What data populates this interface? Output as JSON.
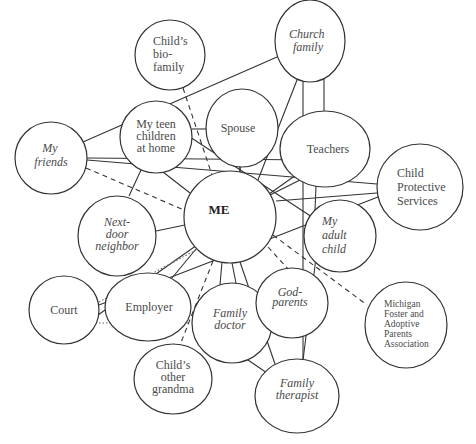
{
  "diagram": {
    "type": "ecomap",
    "nodes": [
      {
        "id": "me",
        "lines": [
          "ME"
        ],
        "style": "bold",
        "cx": 230,
        "cy": 217,
        "rx": 46,
        "ry": 46
      },
      {
        "id": "childs-bio-family",
        "lines": [
          "Child’s",
          "bio-",
          "family"
        ],
        "style": "normal",
        "cx": 170,
        "cy": 55,
        "rx": 35,
        "ry": 35
      },
      {
        "id": "church-family",
        "lines": [
          "Church",
          "family"
        ],
        "style": "italic",
        "cx": 310,
        "cy": 41,
        "rx": 35,
        "ry": 41
      },
      {
        "id": "my-teen-children",
        "lines": [
          "My teen",
          "children",
          "at home"
        ],
        "style": "normal",
        "cx": 156,
        "cy": 137,
        "rx": 36,
        "ry": 36
      },
      {
        "id": "spouse",
        "lines": [
          "Spouse"
        ],
        "style": "normal",
        "cx": 242,
        "cy": 128,
        "rx": 36,
        "ry": 39
      },
      {
        "id": "teachers",
        "lines": [
          "Teachers"
        ],
        "style": "normal",
        "cx": 325,
        "cy": 149,
        "rx": 45,
        "ry": 38
      },
      {
        "id": "my-friends",
        "lines": [
          "My",
          "friends"
        ],
        "style": "italic",
        "cx": 51,
        "cy": 158,
        "rx": 36,
        "ry": 36
      },
      {
        "id": "child-protective-services",
        "lines": [
          "Child",
          "Protective",
          "Services"
        ],
        "style": "normal",
        "cx": 420,
        "cy": 187,
        "rx": 43,
        "ry": 43
      },
      {
        "id": "next-door-neighbor",
        "lines": [
          "Next-",
          "door",
          "neighbor"
        ],
        "style": "italic",
        "cx": 117,
        "cy": 236,
        "rx": 39,
        "ry": 40
      },
      {
        "id": "my-adult-child",
        "lines": [
          "My",
          "adult",
          "child"
        ],
        "style": "italic",
        "cx": 340,
        "cy": 236,
        "rx": 36,
        "ry": 36
      },
      {
        "id": "court",
        "lines": [
          "Court"
        ],
        "style": "normal",
        "cx": 64,
        "cy": 310,
        "rx": 35,
        "ry": 34
      },
      {
        "id": "employer",
        "lines": [
          "Employer"
        ],
        "style": "normal",
        "cx": 148,
        "cy": 307,
        "rx": 43,
        "ry": 34
      },
      {
        "id": "family-doctor",
        "lines": [
          "Family",
          "doctor"
        ],
        "style": "italic",
        "cx": 232,
        "cy": 323,
        "rx": 40,
        "ry": 40
      },
      {
        "id": "god-parents",
        "lines": [
          "God-",
          "parents"
        ],
        "style": "italic",
        "cx": 292,
        "cy": 303,
        "rx": 36,
        "ry": 35
      },
      {
        "id": "michigan-fapa",
        "lines": [
          "Michigan",
          "Foster and",
          "Adoptive",
          "Parents",
          "Association"
        ],
        "style": "small",
        "cx": 406,
        "cy": 325,
        "rx": 41,
        "ry": 43
      },
      {
        "id": "childs-other-grandma",
        "lines": [
          "Child’s",
          "other",
          "grandma"
        ],
        "style": "normal",
        "cx": 173,
        "cy": 379,
        "rx": 39,
        "ry": 35
      },
      {
        "id": "family-therapist",
        "lines": [
          "Family",
          "therapist"
        ],
        "style": "italic",
        "cx": 297,
        "cy": 396,
        "rx": 42,
        "ry": 37
      }
    ],
    "edges": [
      {
        "from": "my-friends",
        "to": "church-family",
        "style": "solid"
      },
      {
        "from": "my-friends",
        "to": "child-protective-services",
        "style": "solid"
      },
      {
        "from": "my-friends",
        "to": "teachers",
        "style": "solid"
      },
      {
        "from": "my-friends",
        "to": "me",
        "style": "dashed"
      },
      {
        "from": "childs-bio-family",
        "to": "me",
        "style": "dashed"
      },
      {
        "from": "my-teen-children",
        "to": "spouse",
        "style": "solid"
      },
      {
        "from": "my-teen-children",
        "to": "me",
        "style": "solid"
      },
      {
        "from": "my-teen-children",
        "to": "my-adult-child",
        "style": "solid"
      },
      {
        "from": "my-teen-children",
        "to": "next-door-neighbor",
        "style": "solid"
      },
      {
        "from": "spouse",
        "to": "me",
        "style": "solid"
      },
      {
        "from": "church-family",
        "to": "teachers",
        "style": "solid"
      },
      {
        "from": "church-family",
        "to": "me",
        "style": "solid"
      },
      {
        "from": "church-family",
        "to": "family-therapist",
        "style": "solid"
      },
      {
        "from": "teachers",
        "to": "me",
        "style": "solid"
      },
      {
        "from": "teachers",
        "to": "court",
        "style": "solid"
      },
      {
        "from": "teachers",
        "to": "my-adult-child",
        "style": "solid"
      },
      {
        "from": "child-protective-services",
        "to": "me",
        "style": "solid"
      },
      {
        "from": "child-protective-services",
        "to": "court",
        "style": "solid"
      },
      {
        "from": "next-door-neighbor",
        "to": "me",
        "style": "solid"
      },
      {
        "from": "my-adult-child",
        "to": "family-therapist",
        "style": "solid"
      },
      {
        "from": "me",
        "to": "family-doctor",
        "style": "solid"
      },
      {
        "from": "me",
        "to": "god-parents",
        "style": "dashed"
      },
      {
        "from": "me",
        "to": "michigan-fapa",
        "style": "dashed"
      },
      {
        "from": "me",
        "to": "family-therapist",
        "style": "solid"
      },
      {
        "from": "me",
        "to": "childs-other-grandma",
        "style": "dashed"
      },
      {
        "from": "me",
        "to": "employer",
        "style": "solid"
      },
      {
        "from": "me",
        "to": "court",
        "style": "dotted"
      },
      {
        "from": "court",
        "to": "employer",
        "style": "dotted"
      },
      {
        "from": "family-doctor",
        "to": "family-therapist",
        "style": "solid"
      }
    ]
  }
}
